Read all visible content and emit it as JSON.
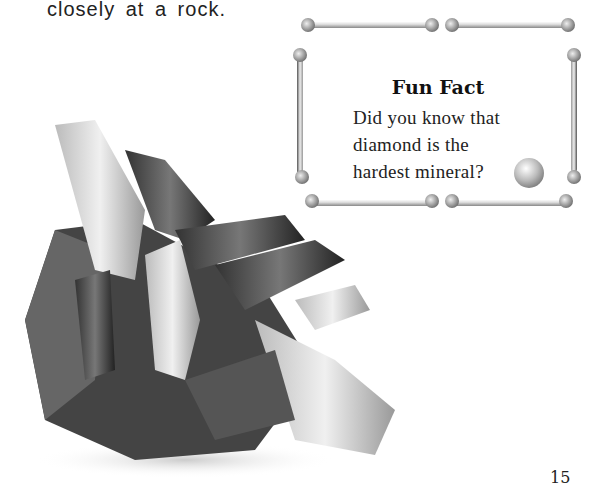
{
  "intro_text": "closely at a rock.",
  "fun_fact": {
    "title": "Fun Fact",
    "lines": [
      "Did you know that",
      "diamond is the",
      "hardest mineral?"
    ]
  },
  "page_number": "15",
  "images": {
    "rock": "quartz-crystal-cluster-photo",
    "diamond": "diamond-gem-icon",
    "frame": "bone-frame-border"
  }
}
